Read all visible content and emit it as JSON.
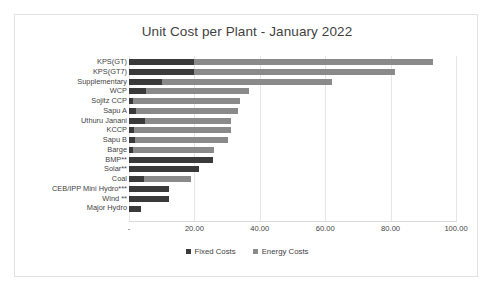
{
  "chart_data": {
    "type": "bar",
    "orientation": "horizontal",
    "stacked": true,
    "title": "Unit Cost per Plant - January 2022",
    "xlabel": "",
    "ylabel": "",
    "xlim": [
      0,
      100
    ],
    "xticks": [
      0,
      20,
      40,
      60,
      80,
      100
    ],
    "xticklabels": [
      " - ",
      "20.00",
      "40.00",
      "60.00",
      "80.00",
      "100.00"
    ],
    "grid": true,
    "legend_position": "bottom",
    "categories": [
      "KPS(GT)",
      "KPS(GT7)",
      "Supplementary",
      "WCP",
      "Sojitz CCP",
      "Sapu A",
      "Uthuru Janani",
      "KCCP",
      "Sapu B",
      "Barge",
      "BMP**",
      "Solar**",
      "Coal",
      "CEB/IPP Mini Hydro***",
      "Wind **",
      "Major Hydro"
    ],
    "series": [
      {
        "name": "Fixed Costs",
        "color": "#3a3a3a",
        "values": [
          20.0,
          20.0,
          10.1,
          5.3,
          1.3,
          2.2,
          5.0,
          1.6,
          1.9,
          1.3,
          25.7,
          21.4,
          4.6,
          12.2,
          12.2,
          3.7
        ]
      },
      {
        "name": "Energy Costs",
        "color": "#8a8a8a",
        "values": [
          72.9,
          61.3,
          52.1,
          31.4,
          32.7,
          31.1,
          26.2,
          29.6,
          28.4,
          24.7,
          0.0,
          0.0,
          14.4,
          0.0,
          0.0,
          0.0
        ]
      }
    ],
    "totals": [
      92.9,
      81.3,
      62.2,
      36.7,
      34.0,
      33.3,
      31.2,
      31.2,
      30.3,
      26.0,
      25.7,
      21.4,
      19.0,
      12.2,
      12.2,
      3.7
    ]
  },
  "legend": {
    "items": [
      {
        "label": "Fixed Costs",
        "color": "#3a3a3a"
      },
      {
        "label": "Energy Costs",
        "color": "#8a8a8a"
      }
    ]
  }
}
